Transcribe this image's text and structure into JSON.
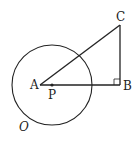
{
  "diagram": {
    "points": {
      "A": {
        "label": "A",
        "x": 40,
        "y": 85
      },
      "P": {
        "label": "P",
        "x": 52,
        "y": 85
      },
      "B": {
        "label": "B",
        "x": 120,
        "y": 85
      },
      "C": {
        "label": "C",
        "x": 120,
        "y": 25
      }
    },
    "circle": {
      "label": "O",
      "cx": 52,
      "cy": 85,
      "r": 40
    },
    "segments": [
      "AB",
      "BC",
      "AC"
    ],
    "right_angle_at": "B",
    "stroke_color": "#222222"
  }
}
